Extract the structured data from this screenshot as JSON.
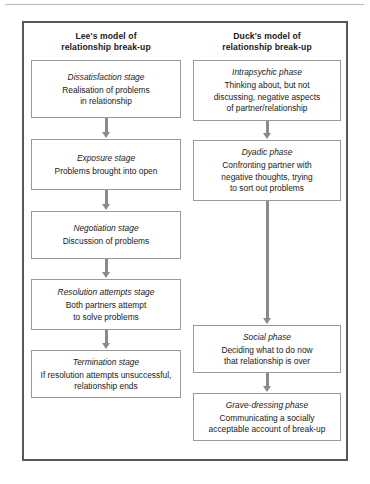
{
  "figure": {
    "columns": [
      {
        "id": "lee",
        "title": "Lee's model of\nrelationship break-up",
        "title_line1": "Lee's model of",
        "title_line2": "relationship break-up",
        "boxes": [
          {
            "stage": "Dissatisfaction stage",
            "desc": "Realisation of problems\nin relationship",
            "desc_line1": "Realisation of problems",
            "desc_line2": "in relationship"
          },
          {
            "stage": "Exposure stage",
            "desc": "Problems brought into open",
            "desc_line1": "Problems brought into open",
            "desc_line2": ""
          },
          {
            "stage": "Negotiation stage",
            "desc": "Discussion of problems",
            "desc_line1": "Discussion of problems",
            "desc_line2": ""
          },
          {
            "stage": "Resolution attempts stage",
            "desc": "Both partners attempt\nto solve problems",
            "desc_line1": "Both partners attempt",
            "desc_line2": "to solve problems"
          },
          {
            "stage": "Termination stage",
            "desc": "If resolution attempts unsuccessful,\nrelationship ends",
            "desc_line1": "If resolution attempts unsuccessful,",
            "desc_line2": "relationship ends"
          }
        ]
      },
      {
        "id": "duck",
        "title": "Duck's model of\nrelationship break-up",
        "title_line1": "Duck's model of",
        "title_line2": "relationship break-up",
        "boxes": [
          {
            "stage": "Intrapsychic phase",
            "desc": "Thinking about, but not\ndiscussing, negative aspects\nof partner/relationship",
            "desc_line1": "Thinking about, but not",
            "desc_line2": "discussing, negative aspects",
            "desc_line3": "of partner/relationship"
          },
          {
            "stage": "Dyadic phase",
            "desc": "Confronting partner with\nnegative thoughts, trying\nto sort out problems",
            "desc_line1": "Confronting partner with",
            "desc_line2": "negative thoughts, trying",
            "desc_line3": "to sort out problems"
          },
          {
            "stage": "Social phase",
            "desc": "Deciding what to do now\nthat relationship is over",
            "desc_line1": "Deciding what to do now",
            "desc_line2": "that relationship is over",
            "desc_line3": ""
          },
          {
            "stage": "Grave-dressing phase",
            "desc": "Communicating a socially\nacceptable account of break-up",
            "desc_line1": "Communicating a socially",
            "desc_line2": "acceptable account of break-up",
            "desc_line3": ""
          }
        ]
      }
    ],
    "colors": {
      "frame_border": "#585858",
      "box_border": "#9a9a9a",
      "arrow": "#8a8a8a",
      "text": "#1a1a1a",
      "rule": "#b9b9b9",
      "background": "#ffffff"
    }
  }
}
